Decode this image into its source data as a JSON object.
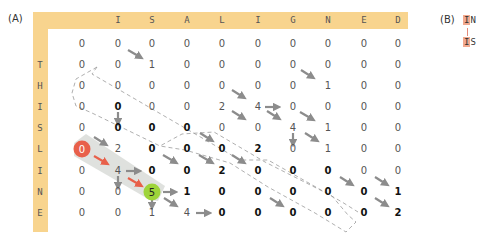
{
  "panel_a": {
    "label": "(A)",
    "column_headers": [
      "",
      "I",
      "S",
      "A",
      "L",
      "I",
      "G",
      "N",
      "E",
      "D"
    ],
    "row_headers": [
      "",
      "T",
      "H",
      "I",
      "S",
      "L",
      "I",
      "N",
      "E"
    ],
    "matrix": [
      [
        "0",
        "0",
        "0",
        "0",
        "0",
        "0",
        "0",
        "0",
        "0",
        "0"
      ],
      [
        "0",
        "0",
        "1",
        "0",
        "0",
        "0",
        "0",
        "0",
        "0",
        "0"
      ],
      [
        "0",
        "0",
        "0",
        "0",
        "0",
        "0",
        "0",
        "1",
        "0",
        "0"
      ],
      [
        "0",
        "0",
        "0",
        "0",
        "2",
        "4",
        "0",
        "0",
        "0",
        "0"
      ],
      [
        "0",
        "0",
        "0",
        "0",
        "0",
        "0",
        "4",
        "1",
        "0",
        "0"
      ],
      [
        "0",
        "2",
        "0",
        "0",
        "0",
        "2",
        "0",
        "1",
        "0",
        "0"
      ],
      [
        "0",
        "4",
        "0",
        "0",
        "2",
        "0",
        "0",
        "0",
        "0",
        "0"
      ],
      [
        "0",
        "0",
        "5",
        "1",
        "0",
        "0",
        "0",
        "0",
        "0",
        "1"
      ],
      [
        "0",
        "0",
        "1",
        "4",
        "0",
        "0",
        "0",
        "0",
        "0",
        "2"
      ]
    ],
    "bold_cells": [
      [
        3,
        1
      ],
      [
        4,
        1
      ],
      [
        4,
        2
      ],
      [
        4,
        3
      ],
      [
        5,
        2
      ],
      [
        5,
        3
      ],
      [
        5,
        4
      ],
      [
        5,
        5
      ],
      [
        6,
        2
      ],
      [
        6,
        3
      ],
      [
        6,
        4
      ],
      [
        6,
        5
      ],
      [
        6,
        6
      ],
      [
        6,
        7
      ],
      [
        7,
        3
      ],
      [
        7,
        4
      ],
      [
        7,
        5
      ],
      [
        7,
        6
      ],
      [
        7,
        7
      ],
      [
        7,
        8
      ],
      [
        7,
        9
      ],
      [
        8,
        4
      ],
      [
        8,
        5
      ],
      [
        8,
        6
      ],
      [
        8,
        7
      ],
      [
        8,
        8
      ],
      [
        8,
        9
      ]
    ],
    "traceback_start": {
      "row": 5,
      "col": 0,
      "value": "0",
      "color": "#e8604a"
    },
    "traceback_end": {
      "row": 7,
      "col": 2,
      "value": "5",
      "color": "#9ed43a"
    },
    "colors": {
      "header_bar": "#f8d48e",
      "arrow_gray": "#8c8c8c",
      "arrow_red": "#e8604a",
      "path_band": "#d9dcd8"
    }
  },
  "panel_b": {
    "label": "(B)",
    "alignment_top": {
      "highlight": "I",
      "rest": "N"
    },
    "alignment_bottom": {
      "highlight": "I",
      "rest": "S"
    }
  }
}
